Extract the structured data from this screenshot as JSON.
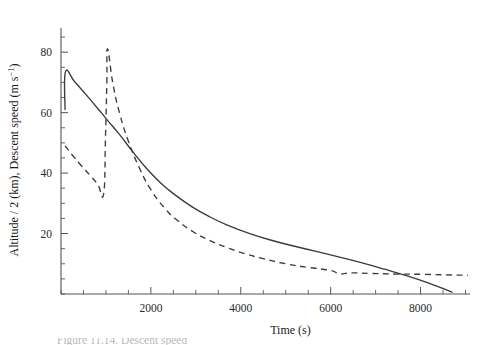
{
  "figure": {
    "background": "#ffffff",
    "line_color": "#3b3b3b",
    "axis_color": "#555555",
    "caption_fragment": "Figure 11.14.  Descent speed"
  },
  "axes": {
    "x_title": "Time (s)",
    "y_title_part1": "Altitude / 2 (km),  Descent speed (m s",
    "y_title_exp": "−1",
    "y_title_part3": ")",
    "x_ticklabels": [
      "2000",
      "4000",
      "6000",
      "8000"
    ],
    "x_tickvalues": [
      2000,
      4000,
      6000,
      8000
    ],
    "y_ticklabels": [
      "20",
      "40",
      "60",
      "80"
    ],
    "y_tickvalues": [
      20,
      40,
      60,
      80
    ]
  },
  "chart_data": {
    "type": "line",
    "title": "",
    "xlabel": "Time (s)",
    "ylabel": "Altitude / 2 (km), Descent speed (m s^-1)",
    "xlim": [
      0,
      9100
    ],
    "ylim": [
      0,
      88
    ],
    "grid": false,
    "legend": "none",
    "x_major_ticks": [
      2000,
      4000,
      6000,
      8000
    ],
    "y_major_ticks": [
      20,
      40,
      60,
      80
    ],
    "x_minor_interval": 500,
    "y_minor_interval": 5,
    "series": [
      {
        "name": "Altitude / 2 (km)",
        "style": "solid",
        "points": [
          [
            90,
            61.0
          ],
          [
            100,
            73.5
          ],
          [
            300,
            70.3
          ],
          [
            600,
            65.2
          ],
          [
            900,
            59.9
          ],
          [
            1050,
            57.2
          ],
          [
            1300,
            52.8
          ],
          [
            1600,
            47.0
          ],
          [
            1900,
            41.6
          ],
          [
            2200,
            37.0
          ],
          [
            2500,
            33.2
          ],
          [
            2900,
            29.0
          ],
          [
            3300,
            25.6
          ],
          [
            3700,
            22.8
          ],
          [
            4200,
            20.0
          ],
          [
            4700,
            17.7
          ],
          [
            5200,
            15.8
          ],
          [
            5700,
            14.0
          ],
          [
            6200,
            12.2
          ],
          [
            6700,
            10.3
          ],
          [
            7200,
            8.2
          ],
          [
            7700,
            6.0
          ],
          [
            8200,
            3.5
          ],
          [
            8700,
            0.6
          ]
        ]
      },
      {
        "name": "Descent speed (m s^-1)",
        "style": "dashed",
        "points": [
          [
            90,
            49.0
          ],
          [
            250,
            46.0
          ],
          [
            450,
            42.5
          ],
          [
            650,
            39.2
          ],
          [
            820,
            36.2
          ],
          [
            950,
            33.2
          ],
          [
            990,
            52.0
          ],
          [
            1020,
            70.0
          ],
          [
            1035,
            81.2
          ],
          [
            1150,
            70.0
          ],
          [
            1300,
            60.0
          ],
          [
            1500,
            50.5
          ],
          [
            1750,
            41.5
          ],
          [
            2000,
            34.5
          ],
          [
            2300,
            28.5
          ],
          [
            2600,
            24.2
          ],
          [
            2950,
            20.5
          ],
          [
            3300,
            17.8
          ],
          [
            3700,
            15.3
          ],
          [
            4100,
            13.3
          ],
          [
            4500,
            11.7
          ],
          [
            5000,
            10.0
          ],
          [
            5500,
            8.8
          ],
          [
            6000,
            7.8
          ],
          [
            6200,
            6.6
          ],
          [
            6450,
            7.0
          ],
          [
            6900,
            6.8
          ],
          [
            7500,
            6.6
          ],
          [
            8100,
            6.5
          ],
          [
            8700,
            6.3
          ],
          [
            9050,
            6.2
          ]
        ]
      }
    ]
  }
}
